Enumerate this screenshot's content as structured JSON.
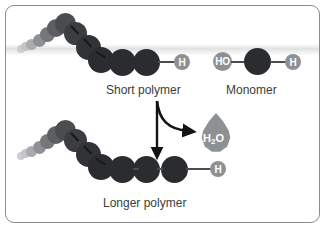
{
  "figure": {
    "background_color": "#ffffff",
    "border_color": "#8a8c8f"
  },
  "colors": {
    "monomer_dark": "#2b2c2f",
    "chain_mid": "#4e5054",
    "chain_far": "#8f9195",
    "cap_gray": "#8e9194",
    "bond": "#4a4c4f",
    "text": "#3b3d40",
    "arrow": "#111315",
    "droplet": "#8e9194"
  },
  "labels": {
    "short_polymer": "Short polymer",
    "monomer": "Monomer",
    "longer_polymer": "Longer polymer"
  },
  "caps": {
    "hydrogen": "H",
    "hydroxyl": "HO"
  },
  "water": {
    "formula_main": "H",
    "formula_sub": "2",
    "formula_tail": "O",
    "full": "H2O"
  },
  "top_row": {
    "polymer_visible_units": 5,
    "terminal_cap": "H",
    "caption": "Short polymer",
    "monomer_units": 1,
    "monomer_left_cap": "HO",
    "monomer_right_cap": "H",
    "monomer_caption": "Monomer"
  },
  "bottom_row": {
    "polymer_visible_units": 6,
    "terminal_cap": "H",
    "caption": "Longer polymer"
  },
  "arrows": {
    "reaction_arrow": "down-arrow",
    "byproduct_arrow": "curved-arrow-to-water"
  },
  "chain_top": [
    {
      "x": 18,
      "y": 43,
      "d": 9,
      "shade": "chain_far"
    },
    {
      "x": 24,
      "y": 41,
      "d": 10,
      "shade": "chain_far"
    },
    {
      "x": 30,
      "y": 38,
      "d": 12,
      "shade": "chain_far"
    },
    {
      "x": 38,
      "y": 34,
      "d": 14,
      "shade": "chain_mid"
    },
    {
      "x": 45,
      "y": 27,
      "d": 17,
      "shade": "chain_mid"
    },
    {
      "x": 53,
      "y": 19,
      "d": 20,
      "shade": "chain_mid"
    },
    {
      "x": 63,
      "y": 25,
      "d": 23,
      "shade": "monomer_dark"
    },
    {
      "x": 77,
      "y": 38,
      "d": 25,
      "shade": "monomer_dark"
    },
    {
      "x": 93,
      "y": 51,
      "d": 27,
      "shade": "monomer_dark"
    },
    {
      "x": 114,
      "y": 55,
      "d": 28,
      "shade": "monomer_dark"
    },
    {
      "x": 139,
      "y": 55,
      "d": 28,
      "shade": "monomer_dark"
    }
  ],
  "chain_bottom": [
    {
      "x": 18,
      "y": 148,
      "d": 9,
      "shade": "chain_far"
    },
    {
      "x": 24,
      "y": 146,
      "d": 10,
      "shade": "chain_far"
    },
    {
      "x": 30,
      "y": 143,
      "d": 12,
      "shade": "chain_far"
    },
    {
      "x": 38,
      "y": 139,
      "d": 14,
      "shade": "chain_mid"
    },
    {
      "x": 45,
      "y": 132,
      "d": 17,
      "shade": "chain_mid"
    },
    {
      "x": 53,
      "y": 124,
      "d": 20,
      "shade": "chain_mid"
    },
    {
      "x": 63,
      "y": 130,
      "d": 23,
      "shade": "monomer_dark"
    },
    {
      "x": 77,
      "y": 143,
      "d": 25,
      "shade": "monomer_dark"
    },
    {
      "x": 93,
      "y": 156,
      "d": 27,
      "shade": "monomer_dark"
    },
    {
      "x": 114,
      "y": 162,
      "d": 28,
      "shade": "monomer_dark"
    },
    {
      "x": 139,
      "y": 162,
      "d": 28,
      "shade": "monomer_dark"
    },
    {
      "x": 166,
      "y": 162,
      "d": 28,
      "shade": "monomer_dark"
    }
  ]
}
